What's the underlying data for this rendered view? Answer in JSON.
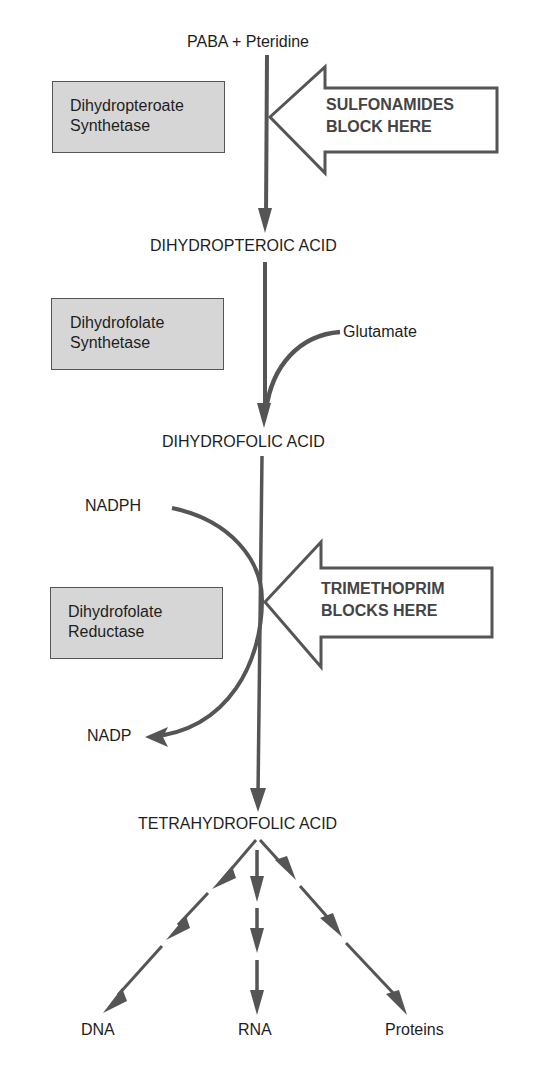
{
  "diagram": {
    "colors": {
      "arrow": "#555555",
      "enzyme_box_fill": "#d6d6d6",
      "enzyme_box_border": "#555555",
      "text": "#1e1e1e"
    },
    "substrates": {
      "start": "PABA + Pteridine",
      "glutamate": "Glutamate",
      "nadph": "NADPH",
      "nadp": "NADP"
    },
    "intermediates": [
      {
        "label": "DIHYDROPTEROIC ACID"
      },
      {
        "label": "DIHYDROFOLIC ACID"
      },
      {
        "label": "TETRAHYDROFOLIC ACID"
      }
    ],
    "enzymes": [
      {
        "line1": "Dihydropteroate",
        "line2": "Synthetase"
      },
      {
        "line1": "Dihydrofolate",
        "line2": "Synthetase"
      },
      {
        "line1": "Dihydrofolate",
        "line2": "Reductase"
      }
    ],
    "inhibitors": [
      {
        "line1": "SULFONAMIDES",
        "line2": "BLOCK HERE"
      },
      {
        "line1": "TRIMETHOPRIM",
        "line2": "BLOCKS HERE"
      }
    ],
    "products": [
      "DNA",
      "RNA",
      "Proteins"
    ]
  }
}
